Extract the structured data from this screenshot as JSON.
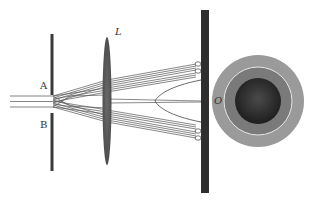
{
  "diagram": {
    "type": "optics-double-slit-lens-screen",
    "labels": {
      "slit_a": "A",
      "slit_b": "B",
      "lens": "L",
      "center_point": "O"
    },
    "colors": {
      "barrier": "#3a3a3a",
      "lens": "#5a5a5a",
      "screen": "#2e2e2e",
      "rays": "#555555",
      "disc_outer": "#9a9a9a",
      "disc_ring": "#e8e8e8",
      "disc_mid": "#7a7a7a",
      "disc_core": "#2a2a2a"
    },
    "components": [
      {
        "name": "incident-beam",
        "description": "three parallel horizontal rays entering from the left"
      },
      {
        "name": "slit-barrier",
        "description": "opaque vertical barrier with two slits A and B"
      },
      {
        "name": "converging-lens",
        "description": "thin convex lens L"
      },
      {
        "name": "screen",
        "description": "vertical observation screen with focus points"
      },
      {
        "name": "interference-pattern",
        "description": "circular pattern viewed face-on with center O"
      }
    ]
  }
}
